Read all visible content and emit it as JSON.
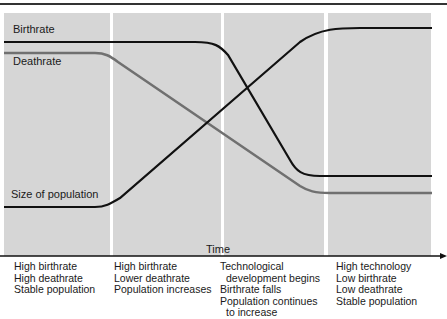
{
  "diagram": {
    "type": "demographic-transition",
    "line_labels": {
      "birthrate": "Birthrate",
      "deathrate": "Deathrate",
      "population": "Size of population"
    },
    "axis_label": "Time",
    "colors": {
      "panel_bg": "#d6d6d6",
      "birthrate_line": "#111111",
      "population_line": "#111111",
      "deathrate_line": "#707070",
      "divider": "#ffffff"
    },
    "stages": [
      {
        "lines": [
          "High birthrate",
          "High deathrate",
          "Stable population"
        ]
      },
      {
        "lines": [
          "High birthrate",
          "Lower deathrate",
          "Population increases"
        ]
      },
      {
        "lines": [
          "Technological",
          "development begins",
          "Birthrate falls",
          "Population continues",
          "to increase"
        ]
      },
      {
        "lines": [
          "High technology",
          "Low birthrate",
          "Low deathrate",
          "Stable population"
        ]
      }
    ]
  }
}
